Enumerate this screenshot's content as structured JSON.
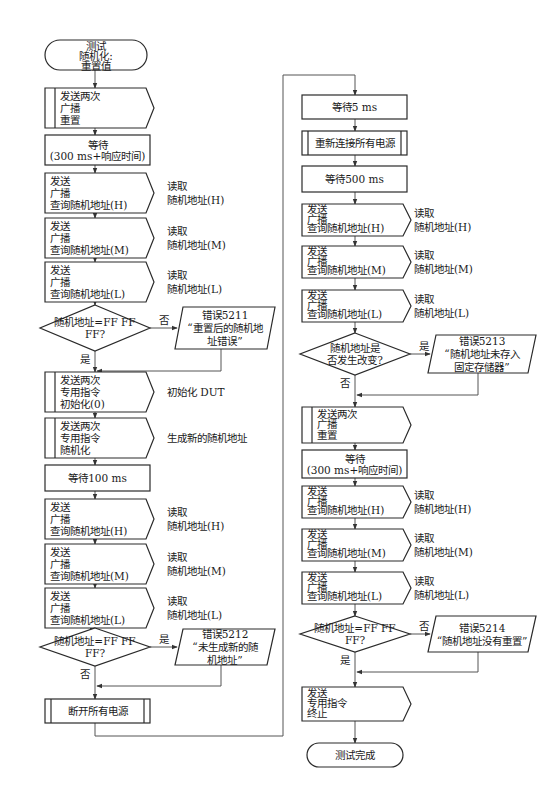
{
  "diagram": {
    "type": "flowchart",
    "start": {
      "lines": [
        "测试",
        "随机化:",
        "重置值"
      ]
    },
    "end": {
      "lines": [
        "测试完成"
      ]
    },
    "left_column": {
      "steps": [
        {
          "id": "l1",
          "kind": "subroutine-send",
          "lines": [
            "发送两次",
            "广播",
            "重置"
          ],
          "note": []
        },
        {
          "id": "l2",
          "kind": "process",
          "lines": [
            "等待",
            "(300 ms+响应时间)"
          ],
          "note": []
        },
        {
          "id": "l3",
          "kind": "send",
          "lines": [
            "发送",
            "广播",
            "查询随机地址(H)"
          ],
          "note": [
            "读取",
            "随机地址(H)"
          ]
        },
        {
          "id": "l4",
          "kind": "send",
          "lines": [
            "发送",
            "广播",
            "查询随机地址(M)"
          ],
          "note": [
            "读取",
            "随机地址(M)"
          ]
        },
        {
          "id": "l5",
          "kind": "send",
          "lines": [
            "发送",
            "广播",
            "查询随机地址(L)"
          ],
          "note": [
            "读取",
            "随机地址(L)"
          ]
        },
        {
          "id": "d1",
          "kind": "decision",
          "lines": [
            "随机地址=FF FF",
            "FF?"
          ],
          "side_label": "否",
          "down_label": "是",
          "error": {
            "lines": [
              "错误5211",
              "“重置后的随机地",
              "址错误”"
            ]
          }
        },
        {
          "id": "l6",
          "kind": "subroutine-send",
          "lines": [
            "发送两次",
            "专用指令",
            "初始化(0)"
          ],
          "note": [
            "初始化 DUT"
          ]
        },
        {
          "id": "l7",
          "kind": "subroutine-send",
          "lines": [
            "发送两次",
            "专用指令",
            "随机化"
          ],
          "note": [
            "生成新的随机地址"
          ]
        },
        {
          "id": "l8",
          "kind": "process",
          "lines": [
            "等待100 ms"
          ],
          "note": []
        },
        {
          "id": "l9",
          "kind": "send",
          "lines": [
            "发送",
            "广播",
            "查询随机地址(H)"
          ],
          "note": [
            "读取",
            "随机地址(H)"
          ]
        },
        {
          "id": "l10",
          "kind": "send",
          "lines": [
            "发送",
            "广播",
            "查询随机地址(M)"
          ],
          "note": [
            "读取",
            "随机地址(M)"
          ]
        },
        {
          "id": "l11",
          "kind": "send",
          "lines": [
            "发送",
            "广播",
            "查询随机地址(L)"
          ],
          "note": [
            "读取",
            "随机地址(L)"
          ]
        },
        {
          "id": "d2",
          "kind": "decision",
          "lines": [
            "随机地址=FF FF",
            "FF?"
          ],
          "side_label": "是",
          "down_label": "否",
          "error": {
            "lines": [
              "错误5212",
              "“未生成新的随",
              "机地址”"
            ]
          }
        },
        {
          "id": "l12",
          "kind": "predefined",
          "lines": [
            "断开所有电源"
          ],
          "note": []
        }
      ]
    },
    "right_column": {
      "steps": [
        {
          "id": "r1",
          "kind": "process",
          "lines": [
            "等待5 ms"
          ],
          "note": []
        },
        {
          "id": "r2",
          "kind": "predefined",
          "lines": [
            "重新连接所有电源"
          ],
          "note": []
        },
        {
          "id": "r3",
          "kind": "process",
          "lines": [
            "等待500 ms"
          ],
          "note": []
        },
        {
          "id": "r4",
          "kind": "send",
          "lines": [
            "发送",
            "广播",
            "查询随机地址(H)"
          ],
          "note": [
            "读取",
            "随机地址(H)"
          ]
        },
        {
          "id": "r5",
          "kind": "send",
          "lines": [
            "发送",
            "广播",
            "查询随机地址(M)"
          ],
          "note": [
            "读取",
            "随机地址(M)"
          ]
        },
        {
          "id": "r6",
          "kind": "send",
          "lines": [
            "发送",
            "广播",
            "查询随机地址(L)"
          ],
          "note": [
            "读取",
            "随机地址(L)"
          ]
        },
        {
          "id": "d3",
          "kind": "decision",
          "lines": [
            "随机地址是",
            "否发生改变?"
          ],
          "side_label": "是",
          "down_label": "否",
          "error": {
            "lines": [
              "错误5213",
              "“随机地址未存入",
              "固定存储器”"
            ]
          }
        },
        {
          "id": "r7",
          "kind": "subroutine-send",
          "lines": [
            "发送两次",
            "广播",
            "重置"
          ],
          "note": []
        },
        {
          "id": "r8",
          "kind": "process",
          "lines": [
            "等待",
            "(300 ms+响应时间)"
          ],
          "note": []
        },
        {
          "id": "r9",
          "kind": "send",
          "lines": [
            "发送",
            "广播",
            "查询随机地址(H)"
          ],
          "note": [
            "读取",
            "随机地址(H)"
          ]
        },
        {
          "id": "r10",
          "kind": "send",
          "lines": [
            "发送",
            "广播",
            "查询随机地址(M)"
          ],
          "note": [
            "读取",
            "随机地址(M)"
          ]
        },
        {
          "id": "r11",
          "kind": "send",
          "lines": [
            "发送",
            "广播",
            "查询随机地址(L)"
          ],
          "note": [
            "读取",
            "随机地址(L)"
          ]
        },
        {
          "id": "d4",
          "kind": "decision",
          "lines": [
            "随机地址=FF FF",
            "FF?"
          ],
          "side_label": "否",
          "down_label": "是",
          "error": {
            "lines": [
              "错误5214",
              "“随机地址没有重置”"
            ]
          }
        },
        {
          "id": "r12",
          "kind": "send",
          "lines": [
            "发送",
            "专用指令",
            "终止"
          ],
          "note": []
        }
      ]
    }
  }
}
